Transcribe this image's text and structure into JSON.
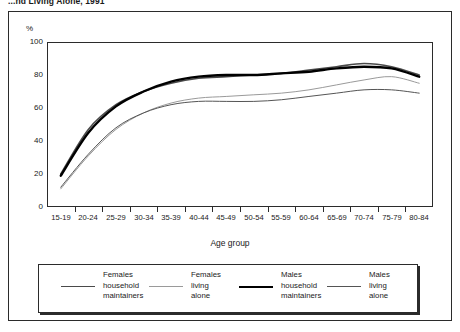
{
  "figure": {
    "title": "...nd Living Alone, 1991",
    "axis_title": "Age group",
    "unit_label": "%"
  },
  "chart_data": {
    "type": "line",
    "title": "...nd Living Alone, 1991",
    "xlabel": "Age group",
    "ylabel": "%",
    "ylim": [
      0,
      100
    ],
    "yticks": [
      0,
      20,
      40,
      60,
      80,
      100
    ],
    "grid": true,
    "legend_position": "bottom",
    "categories": [
      "15-\n19",
      "20-\n24",
      "25-\n29",
      "30-\n34",
      "35-\n39",
      "40-\n44",
      "45-\n49",
      "50-\n54",
      "55-\n59",
      "60-\n64",
      "65-\n69",
      "70-\n74",
      "75-\n79",
      "80-\n84"
    ],
    "category_labels": [
      {
        "top": "15-",
        "bottom": "19"
      },
      {
        "top": "20-",
        "bottom": "24"
      },
      {
        "top": "25-",
        "bottom": "29"
      },
      {
        "top": "30-",
        "bottom": "34"
      },
      {
        "top": "35-",
        "bottom": "39"
      },
      {
        "top": "40-",
        "bottom": "44"
      },
      {
        "top": "45-",
        "bottom": "49"
      },
      {
        "top": "50-",
        "bottom": "54"
      },
      {
        "top": "55-",
        "bottom": "59"
      },
      {
        "top": "60-",
        "bottom": "64"
      },
      {
        "top": "65-",
        "bottom": "69"
      },
      {
        "top": "70-",
        "bottom": "74"
      },
      {
        "top": "75-",
        "bottom": "79"
      },
      {
        "top": "80-",
        "bottom": "84"
      }
    ],
    "series": [
      {
        "name": "Females household maintainers",
        "color": "#4a4a4a",
        "width": 1.6,
        "values": [
          20,
          47,
          62,
          70,
          75,
          78,
          79,
          80,
          81,
          83,
          85,
          87,
          85,
          80
        ]
      },
      {
        "name": "Females living alone",
        "color": "#9a9a9a",
        "width": 1.0,
        "values": [
          11,
          31,
          47,
          57,
          63,
          66,
          67,
          68,
          69,
          71,
          74,
          77,
          79,
          75
        ]
      },
      {
        "name": "Males household maintainers",
        "color": "#000000",
        "width": 2.4,
        "values": [
          19,
          45,
          61,
          70,
          76,
          79,
          80,
          80,
          81,
          82,
          84,
          85,
          84,
          79
        ]
      },
      {
        "name": "Males living alone",
        "color": "#555555",
        "width": 1.0,
        "values": [
          12,
          32,
          48,
          57,
          62,
          64,
          64,
          64,
          65,
          67,
          69,
          71,
          71,
          69
        ]
      }
    ]
  },
  "legend": {
    "items": [
      {
        "line1": "Females",
        "line2": "household",
        "line3": "maintainers",
        "color": "#4a4a4a",
        "width": 1.6
      },
      {
        "line1": "Females",
        "line2": "living",
        "line3": "alone",
        "color": "#9a9a9a",
        "width": 1.0
      },
      {
        "line1": "Males",
        "line2": "household",
        "line3": "maintainers",
        "color": "#000000",
        "width": 2.4
      },
      {
        "line1": "Males",
        "line2": "living",
        "line3": "alone",
        "color": "#555555",
        "width": 1.0
      }
    ]
  }
}
